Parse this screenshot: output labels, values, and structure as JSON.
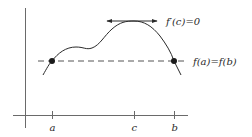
{
  "diagram": {
    "colors": {
      "background": "#ffffff",
      "ink": "#2a2a2a",
      "axis": "#6a6a6a",
      "dashed": "#555555"
    },
    "labels": {
      "tangent": "f′(c)=0",
      "level_line": "f(a)=f(b)",
      "tick_a": "a",
      "tick_c": "c",
      "tick_b": "b"
    },
    "points": [
      {
        "name": "a",
        "x": 52,
        "y": 61
      },
      {
        "name": "b",
        "x": 174,
        "y": 61
      }
    ],
    "ticks": [
      {
        "name": "a",
        "x": 52
      },
      {
        "name": "c",
        "x": 134
      },
      {
        "name": "b",
        "x": 174
      }
    ]
  }
}
